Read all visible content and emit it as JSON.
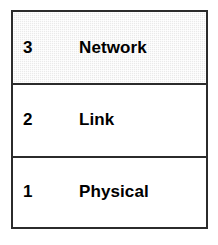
{
  "diagram": {
    "type": "layer-stack",
    "orientation": "bottom-up",
    "colors": {
      "border": "#2b2b2b",
      "row_background": "#ffffff",
      "highlight_background": "#eaeaea",
      "text": "#000000"
    },
    "layers": [
      {
        "number": "3",
        "label": "Network",
        "highlighted": true
      },
      {
        "number": "2",
        "label": "Link",
        "highlighted": false
      },
      {
        "number": "1",
        "label": "Physical",
        "highlighted": false
      }
    ]
  }
}
